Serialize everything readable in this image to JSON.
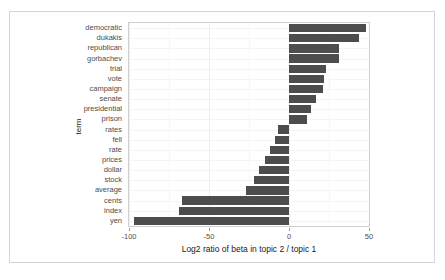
{
  "chart_data": {
    "type": "bar",
    "orientation": "horizontal",
    "title": "",
    "xlabel": "Log2 ratio of beta in topic 2 / topic 1",
    "ylabel": "term",
    "xlim": [
      -100,
      50
    ],
    "xticks": [
      -100,
      -50,
      0,
      50
    ],
    "xtick_labels": [
      "-100",
      "-50",
      "0",
      "50"
    ],
    "grid": true,
    "legend": "none",
    "bar_color": "#4d4d4d",
    "categories": [
      "democratic",
      "dukakis",
      "republican",
      "gorbachev",
      "trial",
      "vote",
      "campaign",
      "senate",
      "presidential",
      "prison",
      "rates",
      "fell",
      "rate",
      "prices",
      "dollar",
      "stock",
      "average",
      "cents",
      "index",
      "yen"
    ],
    "values": [
      48,
      44,
      31,
      31,
      23,
      22,
      21,
      17,
      14,
      11,
      -7,
      -9,
      -12,
      -15,
      -19,
      -22,
      -27,
      -67,
      -69,
      -97
    ]
  }
}
